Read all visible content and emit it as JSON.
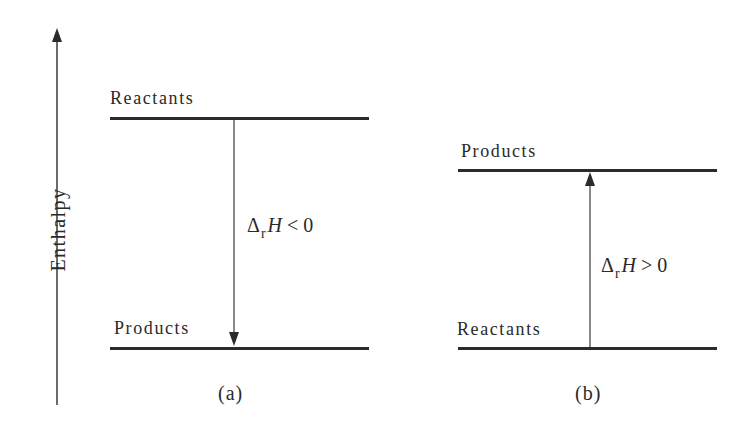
{
  "axis": {
    "label": "Enthalpy",
    "direction": "up"
  },
  "panels": [
    {
      "id": "a",
      "caption": "(a)",
      "upper_level": "Reactants",
      "lower_level": "Products",
      "arrow": "down",
      "delta_symbol": "Δ",
      "delta_sub": "r",
      "delta_var": "H",
      "delta_rel": "< 0"
    },
    {
      "id": "b",
      "caption": "(b)",
      "upper_level": "Products",
      "lower_level": "Reactants",
      "arrow": "up",
      "delta_symbol": "Δ",
      "delta_sub": "r",
      "delta_var": "H",
      "delta_rel": "> 0"
    }
  ],
  "colors": {
    "line": "#2b2b2b",
    "text": "#2a2a2a",
    "background": "#ffffff"
  }
}
